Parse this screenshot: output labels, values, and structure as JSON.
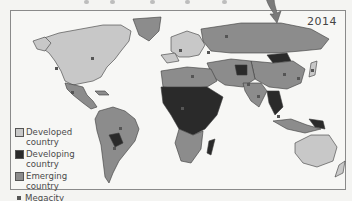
{
  "figure": {
    "year_label": "2014"
  },
  "legend": {
    "items": [
      {
        "label": "Developed country",
        "line1": "Developed",
        "line2": "country",
        "color": "#c8c8c8"
      },
      {
        "label": "Developing country",
        "line1": "Developing",
        "line2": "country",
        "color": "#2a2a2a"
      },
      {
        "label": "Emerging country",
        "line1": "Emerging",
        "line2": "country",
        "color": "#8c8c8c"
      },
      {
        "label": "Megacity",
        "line1": "Megacity",
        "line2": "",
        "color": "#555555"
      }
    ]
  },
  "colors": {
    "developed": "#c8c8c8",
    "developing": "#2a2a2a",
    "emerging": "#8c8c8c",
    "megacity": "#555555",
    "ocean": "#f7f7f5",
    "border": "#8a8a8a"
  }
}
